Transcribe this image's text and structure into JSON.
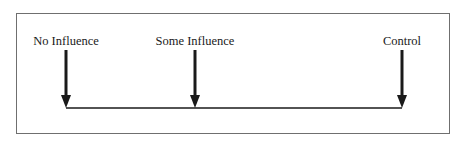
{
  "diagram": {
    "title": "",
    "scale_points": [
      {
        "label": "No Influence"
      },
      {
        "label": "Some Influence"
      },
      {
        "label": "Control"
      }
    ],
    "colors": {
      "line": "#1a1a1a",
      "frame": "#6f6f6f",
      "background": "#ffffff"
    }
  }
}
